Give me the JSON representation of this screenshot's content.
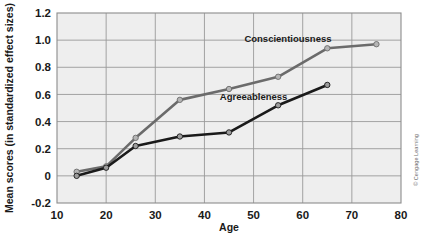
{
  "figure": {
    "credit": "© Cengage Learning",
    "background_color": "#ffffff",
    "plot_background_color": "#eeeeee",
    "grid_color": "#9a9a9a",
    "frame_color": "#8c8c8c"
  },
  "chart_data": {
    "type": "line",
    "title": "",
    "xlabel": "Age",
    "ylabel": "Mean scores (in standardized effect sizes)",
    "xlim": [
      10,
      80
    ],
    "ylim": [
      -0.2,
      1.2
    ],
    "xticks": [
      10,
      20,
      30,
      40,
      50,
      60,
      70,
      80
    ],
    "xticklabels": [
      "10",
      "20",
      "30",
      "40",
      "50",
      "60",
      "70",
      "80"
    ],
    "yticks": [
      -0.2,
      0,
      0.2,
      0.4,
      0.6,
      0.8,
      1.0,
      1.2
    ],
    "yticklabels": [
      "-0.2",
      "0",
      "0.2",
      "0.4",
      "0.6",
      "0.8",
      "1.0",
      "1.2"
    ],
    "grid": true,
    "legend": "inline-annotations",
    "series": [
      {
        "name": "Conscientiousness",
        "color": "#6b6b6b",
        "marker_color": "#b5b5b5",
        "label_x": 57,
        "label_y": 0.99,
        "x": [
          14,
          20,
          26,
          35,
          45,
          55,
          65,
          75
        ],
        "values": [
          0.03,
          0.07,
          0.28,
          0.56,
          0.64,
          0.73,
          0.94,
          0.97
        ]
      },
      {
        "name": "Agreeableness",
        "color": "#1a1a1a",
        "marker_color": "#9c9c9c",
        "label_x": 50,
        "label_y": 0.56,
        "x": [
          14,
          20,
          26,
          35,
          45,
          55,
          65
        ],
        "values": [
          0.0,
          0.06,
          0.22,
          0.29,
          0.32,
          0.52,
          0.67
        ]
      }
    ]
  }
}
